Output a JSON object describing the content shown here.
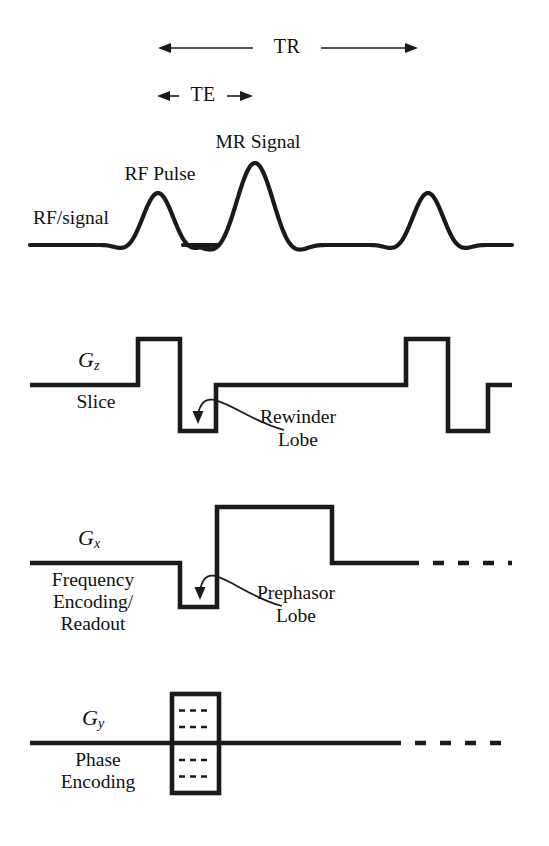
{
  "figure": {
    "width": 549,
    "height": 846,
    "background": "#ffffff",
    "ink": "#1a1a1a"
  },
  "timing_labels": {
    "tr": "TR",
    "te": "TE"
  },
  "rows": {
    "rf": {
      "axis_label": "RF/signal",
      "annotations": {
        "rf_pulse": "RF Pulse",
        "mr_signal": "MR Signal"
      }
    },
    "gz": {
      "axis_label": "G",
      "axis_sub": "z",
      "sub_label": "Slice",
      "annotation": "Rewinder\nLobe",
      "annotation_line1": "Rewinder",
      "annotation_line2": "Lobe"
    },
    "gx": {
      "axis_label": "G",
      "axis_sub": "x",
      "sub_label": "Frequency\nEncoding/\nReadout",
      "sub_line1": "Frequency",
      "sub_line2": "Encoding/",
      "sub_line3": "Readout",
      "annotation": "Prephasor\nLobe",
      "annotation_line1": "Prephasor",
      "annotation_line2": "Lobe"
    },
    "gy": {
      "axis_label": "G",
      "axis_sub": "y",
      "sub_label": "Phase\nEncoding",
      "sub_line1": "Phase",
      "sub_line2": "Encoding"
    }
  },
  "chart_data": {
    "type": "line",
    "xlabel": "time",
    "ylabel": "amplitude",
    "x_range": [
      30,
      512
    ],
    "grid": false,
    "legend": "none",
    "timing_markers": [
      {
        "name": "TR",
        "label": "TR",
        "x_start": 158,
        "x_end": 418,
        "y": 48,
        "label_x": 287
      },
      {
        "name": "TE",
        "label": "TE",
        "x_start": 157,
        "x_end": 253,
        "y": 96,
        "label_x": 203
      }
    ],
    "series": [
      {
        "name": "RF/signal",
        "row": "rf",
        "baseline_y": 245,
        "x_start": 30,
        "x_end": 512,
        "events": [
          {
            "type": "sinc",
            "label": "RF Pulse",
            "center": 158,
            "amplitude": 52,
            "halfwidth": 30,
            "lobes": 1
          },
          {
            "type": "sinc",
            "label": "MR Signal",
            "center": 255,
            "amplitude": 82,
            "halfwidth": 36,
            "lobes": 1
          },
          {
            "type": "sinc",
            "label": "RF Pulse",
            "center": 428,
            "amplitude": 52,
            "halfwidth": 30,
            "lobes": 1
          }
        ]
      },
      {
        "name": "Gz Slice",
        "row": "gz",
        "baseline_y": 385,
        "x_start": 30,
        "x_end": 512,
        "lobes": [
          {
            "type": "positive",
            "x_start": 138,
            "x_end": 180,
            "amplitude": 46,
            "label": "slice select"
          },
          {
            "type": "negative",
            "x_start": 180,
            "x_end": 216,
            "amplitude": -46,
            "label": "Rewinder Lobe"
          },
          {
            "type": "positive",
            "x_start": 406,
            "x_end": 448,
            "amplitude": 46,
            "label": "slice select"
          },
          {
            "type": "negative",
            "x_start": 448,
            "x_end": 488,
            "amplitude": -46,
            "label": "Rewinder Lobe"
          }
        ]
      },
      {
        "name": "Gx Frequency Encoding/Readout",
        "row": "gx",
        "baseline_y": 563,
        "x_start": 30,
        "x_end": 512,
        "dashed_from": 408,
        "lobes": [
          {
            "type": "negative",
            "x_start": 180,
            "x_end": 217,
            "amplitude": -44,
            "label": "Prephasor Lobe"
          },
          {
            "type": "positive",
            "x_start": 217,
            "x_end": 332,
            "amplitude": 56,
            "label": "readout"
          }
        ]
      },
      {
        "name": "Gy Phase Encoding",
        "row": "gy",
        "baseline_y": 743,
        "x_start": 30,
        "x_end": 512,
        "dashed_from": 390,
        "ladder": {
          "x_start": 172,
          "x_end": 219,
          "y_top": 694,
          "y_bottom": 793,
          "step_count": 5,
          "label": "phase encoding steps"
        }
      }
    ],
    "callouts": [
      {
        "name": "rewinder-callout",
        "text": "Rewinder Lobe",
        "target_x": 198,
        "target_y": 424,
        "text_x": 298,
        "text_y": 418
      },
      {
        "name": "prephasor-callout",
        "text": "Prephasor Lobe",
        "target_x": 200,
        "target_y": 600,
        "text_x": 296,
        "text_y": 594
      }
    ]
  }
}
